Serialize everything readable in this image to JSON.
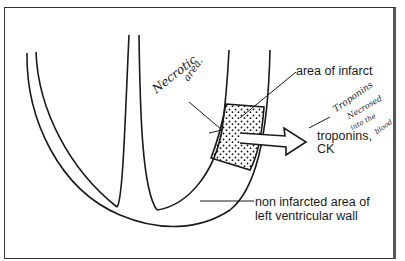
{
  "diagram": {
    "labels": {
      "area_of_infarct": "area of infarct",
      "troponins_line1": "troponins,",
      "troponins_line2": "CK",
      "non_infarcted_line1": "non infarcted area of",
      "non_infarcted_line2": "left ventricular wall"
    },
    "handwritten_notes": {
      "necrotic_line1": "Necrotic",
      "necrotic_line2": "area.",
      "troponins_note_line1": "Troponins",
      "troponins_note_line2": "Necrosed",
      "troponins_note_line3": "into the",
      "troponins_note_line4": "blood"
    },
    "colors": {
      "ink": "#1a1a1a",
      "frame": "#333333",
      "background": "#ffffff"
    }
  }
}
